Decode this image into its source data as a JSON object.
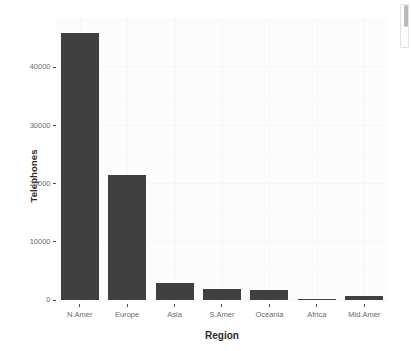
{
  "chart_data": {
    "type": "bar",
    "title": "",
    "subtitle": "",
    "xlabel": "Region",
    "ylabel": "Telephones",
    "categories": [
      "N.Amer",
      "Europe",
      "Asia",
      "S.Amer",
      "Oceania",
      "Africa",
      "Mid.Amer"
    ],
    "values": [
      46000,
      21500,
      2900,
      1900,
      1700,
      200,
      700
    ],
    "ylim": [
      0,
      48500
    ],
    "yticks": [
      0,
      10000,
      20000,
      30000,
      40000
    ],
    "ytick_labels": [
      "0",
      "10000",
      "20000",
      "30000",
      "40000"
    ],
    "grid": true,
    "legend": "none",
    "bar_color": "#404040",
    "panel_color": "#fcfcfc",
    "axis_text_color": "#6b6b6b",
    "axis_title_color": "#2b2b2b"
  },
  "scrollbar": {
    "name": "vertical-scrollbar",
    "thumb_color": "#b9b9b9"
  }
}
